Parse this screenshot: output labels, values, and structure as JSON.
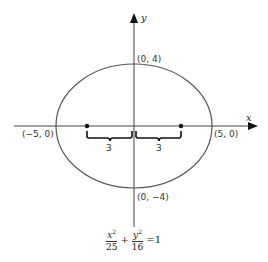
{
  "diagram": {
    "type": "ellipse",
    "axes": {
      "x_label": "x",
      "y_label": "y"
    },
    "vertices": [
      {
        "label": "(0, 4)"
      },
      {
        "label": "(0, −4)"
      },
      {
        "label": "(−5, 0)"
      },
      {
        "label": "(5, 0)"
      }
    ],
    "foci_distance_labels": [
      "3",
      "3"
    ],
    "equation": {
      "term1": {
        "numerator": "x",
        "exponent": "2",
        "denominator": "25"
      },
      "plus": "+",
      "term2": {
        "numerator": "y",
        "exponent": "2",
        "denominator": "16"
      },
      "equals": "=1"
    },
    "colors": {
      "stroke": "#333333",
      "background": "#ffffff"
    }
  }
}
